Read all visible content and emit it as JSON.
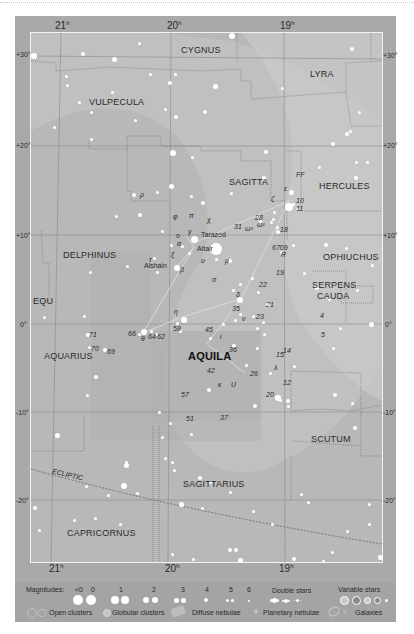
{
  "chart": {
    "constellation_focus": "AQUILA",
    "ra_labels_top": [
      {
        "value": "21",
        "unit": "h",
        "x": 55
      },
      {
        "value": "20",
        "unit": "h",
        "x": 167
      },
      {
        "value": "19",
        "unit": "h",
        "x": 280
      }
    ],
    "ra_labels_bottom": [
      {
        "value": "21",
        "unit": "h",
        "x": 49
      },
      {
        "value": "20",
        "unit": "h",
        "x": 165
      },
      {
        "value": "19",
        "unit": "h",
        "x": 279
      }
    ],
    "dec_labels_left": [
      {
        "value": "+30°",
        "y": 52
      },
      {
        "value": "+20°",
        "y": 143
      },
      {
        "value": "+10°",
        "y": 233
      },
      {
        "value": "0°",
        "y": 322
      },
      {
        "value": "-10°",
        "y": 410
      },
      {
        "value": "-20°",
        "y": 498
      }
    ],
    "dec_labels_right": [
      {
        "value": "+30°",
        "y": 53
      },
      {
        "value": "+20°",
        "y": 143
      },
      {
        "value": "+10°",
        "y": 233
      },
      {
        "value": "0°",
        "y": 322
      },
      {
        "value": "-10°",
        "y": 410
      },
      {
        "value": "-20°",
        "y": 498
      }
    ],
    "constellations": [
      {
        "name": "CYGNUS",
        "x": 180,
        "y": 44
      },
      {
        "name": "LYRA",
        "x": 309,
        "y": 68
      },
      {
        "name": "VULPECULA",
        "x": 88,
        "y": 96
      },
      {
        "name": "SAGITTA",
        "x": 228,
        "y": 176
      },
      {
        "name": "HERCULES",
        "x": 318,
        "y": 180
      },
      {
        "name": "DELPHINUS",
        "x": 62,
        "y": 249
      },
      {
        "name": "OPHIUCHUS",
        "x": 329,
        "y": 251
      },
      {
        "name": "SERPENS",
        "x": 311,
        "y": 279
      },
      {
        "name": "CAUDA",
        "x": 316,
        "y": 290
      },
      {
        "name": "EQU",
        "x": 33,
        "y": 295
      },
      {
        "name": "AQUARIUS",
        "x": 43,
        "y": 350
      },
      {
        "name": "AQUILA",
        "x": 189,
        "y": 350
      },
      {
        "name": "SCUTUM",
        "x": 310,
        "y": 433
      },
      {
        "name": "SAGITTARIUS",
        "x": 184,
        "y": 478
      },
      {
        "name": "CAPRICORNUS",
        "x": 66,
        "y": 527
      }
    ],
    "ecliptic_label": "ECLIPTIC",
    "star_labels": [
      {
        "text": "FF",
        "x": 296,
        "y": 172,
        "italic": true
      },
      {
        "text": "ε",
        "x": 283,
        "y": 186,
        "italic": true
      },
      {
        "text": "ζ",
        "x": 270,
        "y": 197,
        "italic": true
      },
      {
        "text": "10",
        "x": 296,
        "y": 197,
        "italic": true
      },
      {
        "text": "11",
        "x": 296,
        "y": 205,
        "italic": true
      },
      {
        "text": "28",
        "x": 254,
        "y": 213,
        "italic": true
      },
      {
        "text": "ω²",
        "x": 245,
        "y": 224,
        "italic": true
      },
      {
        "text": "ω¹",
        "x": 256,
        "y": 220,
        "italic": true
      },
      {
        "text": "31",
        "x": 234,
        "y": 222,
        "italic": true
      },
      {
        "text": "18",
        "x": 279,
        "y": 225,
        "italic": true
      },
      {
        "text": "φ",
        "x": 173,
        "y": 212,
        "italic": true
      },
      {
        "text": "π",
        "x": 188,
        "y": 212,
        "italic": true
      },
      {
        "text": "χ",
        "x": 206,
        "y": 216,
        "italic": true
      },
      {
        "text": "γ",
        "x": 188,
        "y": 226,
        "italic": true
      },
      {
        "text": "ο",
        "x": 177,
        "y": 232,
        "italic": true
      },
      {
        "text": "α",
        "x": 175,
        "y": 240,
        "italic": true
      },
      {
        "text": "ξ",
        "x": 171,
        "y": 250,
        "italic": true
      },
      {
        "text": "υ",
        "x": 200,
        "y": 257,
        "italic": true
      },
      {
        "text": "μ",
        "x": 225,
        "y": 257,
        "italic": true
      },
      {
        "text": "τ",
        "x": 149,
        "y": 256,
        "italic": true
      },
      {
        "text": "β",
        "x": 180,
        "y": 266,
        "italic": true
      },
      {
        "text": "σ",
        "x": 212,
        "y": 276,
        "italic": true
      },
      {
        "text": "δ",
        "x": 236,
        "y": 291,
        "italic": true
      },
      {
        "text": "θ",
        "x": 141,
        "y": 334,
        "italic": true
      },
      {
        "text": "η",
        "x": 174,
        "y": 308,
        "italic": true
      },
      {
        "text": "ι",
        "x": 219,
        "y": 333,
        "italic": true
      },
      {
        "text": "ν",
        "x": 241,
        "y": 315,
        "italic": true
      },
      {
        "text": "κ",
        "x": 218,
        "y": 381,
        "italic": true
      },
      {
        "text": "λ",
        "x": 274,
        "y": 363,
        "italic": true
      },
      {
        "text": "R",
        "x": 281,
        "y": 250,
        "italic": true
      },
      {
        "text": "U",
        "x": 231,
        "y": 382,
        "italic": true
      },
      {
        "text": "6709",
        "x": 272,
        "y": 242,
        "italic": true
      },
      {
        "text": "19",
        "x": 276,
        "y": 268,
        "italic": true
      },
      {
        "text": "22",
        "x": 259,
        "y": 280,
        "italic": true
      },
      {
        "text": "21",
        "x": 266,
        "y": 301,
        "italic": true
      },
      {
        "text": "35",
        "x": 232,
        "y": 304,
        "italic": true
      },
      {
        "text": "23",
        "x": 256,
        "y": 312,
        "italic": true
      },
      {
        "text": "4",
        "x": 320,
        "y": 311,
        "italic": true
      },
      {
        "text": "5",
        "x": 321,
        "y": 330,
        "italic": true
      },
      {
        "text": "45",
        "x": 205,
        "y": 325,
        "italic": true
      },
      {
        "text": "36",
        "x": 229,
        "y": 345,
        "italic": true
      },
      {
        "text": "42",
        "x": 207,
        "y": 367,
        "italic": true
      },
      {
        "text": "26",
        "x": 250,
        "y": 369,
        "italic": true
      },
      {
        "text": "15",
        "x": 276,
        "y": 350,
        "italic": true
      },
      {
        "text": "14",
        "x": 283,
        "y": 347,
        "italic": true
      },
      {
        "text": "12",
        "x": 283,
        "y": 379,
        "italic": true
      },
      {
        "text": "20",
        "x": 266,
        "y": 390,
        "italic": true
      },
      {
        "text": "57",
        "x": 181,
        "y": 390,
        "italic": true
      },
      {
        "text": "51",
        "x": 186,
        "y": 415,
        "italic": true
      },
      {
        "text": "37",
        "x": 220,
        "y": 413,
        "italic": true
      },
      {
        "text": "58",
        "x": 173,
        "y": 325,
        "italic": true
      },
      {
        "text": "66",
        "x": 128,
        "y": 330,
        "italic": true
      },
      {
        "text": "64",
        "x": 148,
        "y": 333,
        "italic": true
      },
      {
        "text": "62",
        "x": 157,
        "y": 333,
        "italic": true
      },
      {
        "text": "71",
        "x": 89,
        "y": 331,
        "italic": true
      },
      {
        "text": "70",
        "x": 91,
        "y": 345,
        "italic": true
      },
      {
        "text": "69",
        "x": 107,
        "y": 348,
        "italic": true
      },
      {
        "text": "ρ",
        "x": 140,
        "y": 191,
        "italic": true
      }
    ],
    "named_stars": [
      {
        "name": "Tarazed",
        "x": 199,
        "y": 233
      },
      {
        "name": "Altair",
        "x": 194,
        "y": 246
      },
      {
        "name": "Alshain",
        "x": 148,
        "y": 263
      }
    ]
  },
  "legend": {
    "magnitudes_label": "Magnitudes:",
    "magnitudes": [
      "<0",
      "0",
      "1",
      "2",
      "3",
      "4",
      "5",
      "6"
    ],
    "double_stars_label": "Double stars",
    "variable_stars_label": "Variable stars",
    "open_clusters_label": "Open clusters",
    "globular_clusters_label": "Globular clusters",
    "diffuse_nebulae_label": "Diffuse nebulae",
    "planetary_nebulae_label": "Planetary nebulae",
    "galaxies_label": "Galaxies"
  },
  "colors": {
    "outer_frame": "#a9a9a9",
    "chart_background": "#b8b8b8",
    "milky_way_band": "#c8c8c8",
    "boundary_line": "#7a7a7a",
    "star": "#ffffff",
    "text": "#2a2a2a"
  }
}
